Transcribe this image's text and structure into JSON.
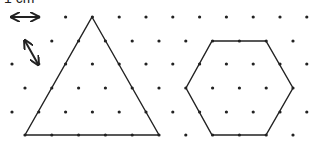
{
  "scale_label": "1 cm",
  "grid": {
    "type": "isometric-dot",
    "spacing_px": 26.8,
    "rows": [
      {
        "y": 17,
        "offset": 0
      },
      {
        "y": 41,
        "offset": 1
      },
      {
        "y": 64,
        "offset": 0
      },
      {
        "y": 88,
        "offset": 1
      },
      {
        "y": 112,
        "offset": 0
      },
      {
        "y": 135,
        "offset": 1
      }
    ],
    "dot_color": "#222222"
  },
  "scale_arrows": [
    {
      "name": "horizontal-1cm-arrow",
      "from": [
        12,
        17
      ],
      "to": [
        38,
        17
      ]
    },
    {
      "name": "diagonal-1cm-arrow",
      "from": [
        25,
        41
      ],
      "to": [
        38,
        64
      ]
    }
  ],
  "shapes": [
    {
      "name": "triangle",
      "points": [
        [
          92,
          17
        ],
        [
          159,
          135
        ],
        [
          25,
          135
        ]
      ]
    },
    {
      "name": "hexagon",
      "points": [
        [
          212,
          41
        ],
        [
          266,
          41
        ],
        [
          293,
          88
        ],
        [
          266,
          135
        ],
        [
          212,
          135
        ],
        [
          186,
          88
        ]
      ]
    }
  ],
  "line_color": "#222222"
}
